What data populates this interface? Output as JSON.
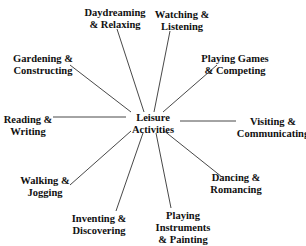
{
  "diagram": {
    "type": "mind-map",
    "line_color": "#333333",
    "text_color": "#111111",
    "center": {
      "lines": [
        "Leisure",
        "Activities"
      ],
      "x": 153,
      "y": 112
    },
    "nodes": [
      {
        "id": "daydreaming",
        "lines": [
          "Daydreaming",
          "& Relaxing"
        ],
        "x": 115,
        "y": 7,
        "line": [
          117,
          29,
          144,
          112
        ]
      },
      {
        "id": "watching",
        "lines": [
          "Watching &",
          "Listening"
        ],
        "x": 182,
        "y": 9,
        "line": [
          170,
          31,
          154,
          112
        ]
      },
      {
        "id": "gardening",
        "lines": [
          "Gardening &",
          "Constructing"
        ],
        "x": 43,
        "y": 53,
        "line": [
          70,
          65,
          131,
          112
        ]
      },
      {
        "id": "playing-games",
        "lines": [
          "Playing Games",
          "& Competing"
        ],
        "x": 235,
        "y": 53,
        "line": [
          217,
          65,
          163,
          112
        ]
      },
      {
        "id": "reading",
        "lines": [
          "Reading &",
          "Writing"
        ],
        "x": 28,
        "y": 114,
        "line": [
          53,
          117,
          126,
          117
        ]
      },
      {
        "id": "visiting",
        "lines": [
          "Visiting &",
          "Communicating"
        ],
        "x": 273,
        "y": 116,
        "line": [
          180,
          121,
          236,
          121
        ]
      },
      {
        "id": "walking",
        "lines": [
          "Walking &",
          "Jogging"
        ],
        "x": 45,
        "y": 175,
        "line": [
          70,
          185,
          131,
          131
        ]
      },
      {
        "id": "dancing",
        "lines": [
          "Dancing &",
          "Romancing"
        ],
        "x": 236,
        "y": 172,
        "line": [
          222,
          177,
          163,
          130
        ]
      },
      {
        "id": "inventing",
        "lines": [
          "Inventing &",
          "Discovering"
        ],
        "x": 99,
        "y": 213,
        "line": [
          116,
          211,
          143,
          133
        ]
      },
      {
        "id": "playing-instruments",
        "lines": [
          "Playing",
          "Instruments",
          "& Painting"
        ],
        "x": 183,
        "y": 210,
        "line": [
          171,
          208,
          156,
          133
        ]
      }
    ]
  }
}
